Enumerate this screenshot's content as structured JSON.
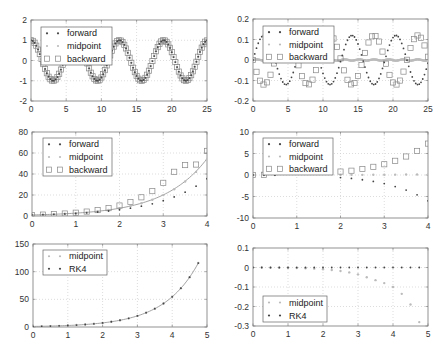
{
  "figure": {
    "width": 446,
    "height": 350,
    "grid": "dotted",
    "frame_color": "#777777"
  },
  "colors": {
    "dark": "#444444",
    "light": "#bbbbbb",
    "square": "#888888",
    "line": "#999999"
  },
  "chart_data": [
    {
      "id": "p1",
      "type": "line",
      "title": "",
      "xlabel": "",
      "ylabel": "",
      "frame": [
        31,
        20,
        207,
        101
      ],
      "xlim": [
        0,
        25
      ],
      "ylim": [
        -2,
        2
      ],
      "xticks": [
        0,
        5,
        10,
        15,
        20,
        25
      ],
      "yticks": [
        -2,
        -1,
        0,
        1,
        2
      ],
      "xtick_labels": [
        "0",
        "5",
        "10",
        "15",
        "20",
        "25"
      ],
      "ytick_labels": [
        "-2",
        "-1",
        "0",
        "1",
        "2"
      ],
      "legend": {
        "position": "upper left",
        "box": [
          41,
          27,
          112,
          65
        ],
        "entries": [
          "forward",
          "midpoint",
          "backward"
        ]
      },
      "series": [
        {
          "name": "forward",
          "marker": "dot",
          "color": "#444444",
          "func": "cos",
          "amp": 1.0,
          "growth": 0,
          "h": 0.25,
          "xmax": 25
        },
        {
          "name": "midpoint",
          "marker": "dot",
          "color": "#bbbbbb",
          "func": "cos",
          "amp": 1.0,
          "growth": 0,
          "h": 0.25,
          "xmax": 25
        },
        {
          "name": "backward",
          "marker": "square",
          "color": "#888888",
          "func": "cos",
          "amp": 1.0,
          "growth": 0,
          "h": 0.25,
          "xmax": 25
        }
      ],
      "description": "Numerical solutions of a harmonic oscillator; all three methods overlap at cos(t) with amplitude ~1"
    },
    {
      "id": "p2",
      "type": "line",
      "title": "",
      "xlabel": "",
      "ylabel": "",
      "frame": [
        253,
        19,
        428,
        101
      ],
      "xlim": [
        0,
        25
      ],
      "ylim": [
        -0.2,
        0.2
      ],
      "xticks": [
        0,
        5,
        10,
        15,
        20,
        25
      ],
      "yticks": [
        -0.2,
        -0.1,
        0,
        0.1,
        0.2
      ],
      "xtick_labels": [
        "0",
        "5",
        "10",
        "15",
        "20",
        "25"
      ],
      "ytick_labels": [
        "-0.2",
        "-0.1",
        "0",
        "0.1",
        "0.2"
      ],
      "legend": {
        "position": "upper left",
        "box": [
          263,
          26,
          334,
          63
        ],
        "entries": [
          "forward",
          "midpoint",
          "backward"
        ]
      },
      "series": [
        {
          "name": "forward",
          "marker": "dot",
          "color": "#444444",
          "func": "sin",
          "amp": 0.12,
          "growth": 0,
          "h": 0.25,
          "xmax": 25
        },
        {
          "name": "midpoint",
          "marker": "dot",
          "color": "#bbbbbb",
          "func": "zero",
          "amp": 0.003,
          "growth": 0,
          "h": 0.1,
          "xmax": 25
        },
        {
          "name": "backward",
          "marker": "square",
          "color": "#888888",
          "func": "-sin",
          "amp": 0.12,
          "growth": 0,
          "h": 0.5,
          "xmax": 25
        }
      ],
      "description": "Error curves: forward ~ +0.12 sin(t), backward ~ -0.12 sin(t), midpoint ~ 0"
    },
    {
      "id": "p3",
      "type": "line",
      "title": "",
      "xlabel": "",
      "ylabel": "",
      "frame": [
        32,
        132,
        207,
        216
      ],
      "xlim": [
        0,
        4
      ],
      "ylim": [
        0,
        80
      ],
      "xticks": [
        0,
        1,
        2,
        3,
        4
      ],
      "yticks": [
        0,
        20,
        40,
        60,
        80
      ],
      "xtick_labels": [
        "0",
        "1",
        "2",
        "3",
        "4"
      ],
      "ytick_labels": [
        "0",
        "20",
        "40",
        "60",
        "80"
      ],
      "legend": {
        "position": "upper left",
        "box": [
          43,
          138,
          112,
          176
        ],
        "entries": [
          "forward",
          "midpoint",
          "backward"
        ]
      },
      "reference_line": {
        "func": "exp",
        "values_at_x": {
          "0": 1,
          "1": 2.72,
          "2": 7.39,
          "3": 20.1,
          "4": 54.6
        }
      },
      "series": [
        {
          "name": "forward",
          "marker": "dot",
          "color": "#444444",
          "x": [
            0,
            0.25,
            0.5,
            0.75,
            1,
            1.25,
            1.5,
            1.75,
            2,
            2.25,
            2.5,
            2.75,
            3,
            3.25,
            3.5,
            3.75,
            4
          ],
          "y": [
            1,
            1.25,
            1.56,
            1.95,
            2.44,
            3.05,
            3.81,
            4.77,
            5.96,
            7.45,
            9.31,
            11.6,
            14.6,
            18.2,
            22.7,
            28.4,
            35.5
          ]
        },
        {
          "name": "midpoint",
          "marker": "dot",
          "color": "#bbbbbb",
          "x": [
            0,
            0.25,
            0.5,
            0.75,
            1,
            1.25,
            1.5,
            1.75,
            2,
            2.25,
            2.5,
            2.75,
            3,
            3.25,
            3.5,
            3.75,
            4
          ],
          "y": [
            1,
            1.28,
            1.64,
            2.11,
            2.71,
            3.48,
            4.46,
            5.72,
            7.34,
            9.42,
            12.1,
            15.5,
            19.9,
            25.5,
            32.8,
            42.0,
            53.9
          ]
        },
        {
          "name": "backward",
          "marker": "square",
          "color": "#888888",
          "x": [
            0,
            0.25,
            0.5,
            0.75,
            1,
            1.25,
            1.5,
            1.75,
            2,
            2.25,
            2.5,
            2.75,
            3,
            3.25,
            3.5,
            3.75,
            4
          ],
          "y": [
            1,
            1.33,
            1.78,
            2.37,
            3.16,
            4.21,
            5.62,
            7.49,
            9.99,
            13.3,
            17.8,
            23.7,
            31.6,
            42.1,
            48.5,
            49,
            62
          ]
        }
      ],
      "description": "Exponential growth y'=y; backward overshoots (~62 at x=4), forward undershoots (~50), midpoint near exp(x)"
    },
    {
      "id": "p4",
      "type": "scatter",
      "title": "",
      "xlabel": "",
      "ylabel": "",
      "frame": [
        253,
        132,
        428,
        218
      ],
      "xlim": [
        0,
        4
      ],
      "ylim": [
        -10,
        10
      ],
      "xticks": [
        0,
        1,
        2,
        3,
        4
      ],
      "yticks": [
        -10,
        -5,
        0,
        5,
        10
      ],
      "xtick_labels": [
        "0",
        "1",
        "2",
        "3",
        "4"
      ],
      "ytick_labels": [
        "-10",
        "-5",
        "0",
        "5",
        "10"
      ],
      "legend": {
        "position": "upper left",
        "box": [
          263,
          138,
          333,
          175
        ],
        "entries": [
          "forward",
          "midpoint",
          "backward"
        ]
      },
      "series": [
        {
          "name": "forward",
          "marker": "dot",
          "color": "#444444",
          "x": [
            0,
            0.25,
            0.5,
            2,
            2.25,
            2.5,
            2.75,
            3,
            3.25,
            3.5,
            3.75,
            4
          ],
          "y": [
            0,
            -0.02,
            -0.05,
            -0.6,
            -0.8,
            -1.1,
            -1.5,
            -2.0,
            -2.7,
            -3.5,
            -4.6,
            -6.0
          ]
        },
        {
          "name": "midpoint",
          "marker": "dot",
          "color": "#bbbbbb",
          "x": [
            0,
            0.25,
            0.5,
            2,
            2.25,
            2.5,
            2.75,
            3,
            3.25,
            3.5,
            3.75,
            4
          ],
          "y": [
            0,
            0,
            0,
            0.02,
            0.03,
            0.04,
            0.05,
            0.06,
            0.08,
            0.1,
            0.12,
            0.15
          ]
        },
        {
          "name": "backward",
          "marker": "square",
          "color": "#888888",
          "x": [
            0,
            0.25,
            2,
            2.25,
            2.5,
            2.75,
            3,
            3.25,
            3.5,
            3.75,
            4
          ],
          "y": [
            0,
            0.05,
            0.8,
            1.0,
            1.4,
            1.9,
            2.5,
            3.3,
            4.3,
            5.6,
            7.3
          ]
        }
      ],
      "description": "Errors vs exact solution: backward positive growing to ~7.3, forward negative to ~-6, midpoint ~0"
    },
    {
      "id": "p5",
      "type": "line",
      "title": "",
      "xlabel": "",
      "ylabel": "",
      "frame": [
        33,
        244,
        207,
        327
      ],
      "xlim": [
        0,
        5
      ],
      "ylim": [
        0,
        150
      ],
      "xticks": [
        0,
        1,
        2,
        3,
        4,
        5
      ],
      "yticks": [
        0,
        50,
        100,
        150
      ],
      "xtick_labels": [
        "0",
        "1",
        "2",
        "3",
        "4",
        "5"
      ],
      "ytick_labels": [
        "0",
        "50",
        "100",
        "150"
      ],
      "legend": {
        "position": "upper left",
        "box": [
          43,
          250,
          107,
          275
        ],
        "entries": [
          "midpoint",
          "RK4"
        ]
      },
      "reference_line": {
        "func": "exp",
        "xmax": 4.75
      },
      "series": [
        {
          "name": "midpoint",
          "marker": "dot",
          "color": "#bbbbbb",
          "x": [
            0,
            0.25,
            0.5,
            0.75,
            1,
            1.25,
            1.5,
            1.75,
            2,
            2.25,
            2.5,
            2.75,
            3,
            3.25,
            3.5,
            3.75,
            4,
            4.25,
            4.5,
            4.75
          ],
          "y": [
            1,
            1.28,
            1.65,
            2.12,
            2.72,
            3.49,
            4.48,
            5.75,
            7.38,
            9.48,
            12.2,
            15.6,
            20.1,
            25.8,
            33.1,
            42.5,
            54.6,
            70.1,
            90.0,
            115.6
          ]
        },
        {
          "name": "RK4",
          "marker": "dot",
          "color": "#444444",
          "x": [
            0,
            0.25,
            0.5,
            0.75,
            1,
            1.25,
            1.5,
            1.75,
            2,
            2.25,
            2.5,
            2.75,
            3,
            3.25,
            3.5,
            3.75,
            4,
            4.25,
            4.5,
            4.75
          ],
          "y": [
            1,
            1.28,
            1.65,
            2.12,
            2.72,
            3.49,
            4.48,
            5.75,
            7.39,
            9.49,
            12.2,
            15.6,
            20.1,
            25.8,
            33.1,
            42.5,
            54.6,
            70.1,
            90.0,
            115.6
          ]
        }
      ],
      "description": "Midpoint and RK4 solutions of y'=y overlap on exp(x), reaching ~118 at x=4.75"
    },
    {
      "id": "p6",
      "type": "scatter",
      "title": "",
      "xlabel": "",
      "ylabel": "",
      "frame": [
        253,
        248,
        428,
        326
      ],
      "xlim": [
        0,
        5
      ],
      "ylim": [
        -0.3,
        0.1
      ],
      "xticks": [
        0,
        1,
        2,
        3,
        4,
        5
      ],
      "yticks": [
        -0.3,
        -0.2,
        -0.1,
        0,
        0.1
      ],
      "xtick_labels": [
        "0",
        "1",
        "2",
        "3",
        "4",
        "5"
      ],
      "ytick_labels": [
        "-0.3",
        "-0.2",
        "-0.1",
        "0",
        "0.1"
      ],
      "legend": {
        "position": "lower left",
        "box": [
          263,
          296,
          327,
          322
        ],
        "entries": [
          "midpoint",
          "RK4"
        ]
      },
      "series": [
        {
          "name": "midpoint",
          "marker": "dot",
          "color": "#bbbbbb",
          "x": [
            0,
            0.25,
            0.5,
            0.75,
            1,
            1.25,
            1.5,
            1.75,
            2,
            2.25,
            2.5,
            2.75,
            3,
            3.25,
            3.5,
            3.75,
            4,
            4.25,
            4.5,
            4.75
          ],
          "y": [
            0,
            0,
            -0.001,
            -0.001,
            -0.002,
            -0.003,
            -0.004,
            -0.006,
            -0.009,
            -0.013,
            -0.018,
            -0.025,
            -0.035,
            -0.05,
            -0.065,
            -0.08,
            -0.1,
            -0.135,
            -0.19,
            -0.28
          ]
        },
        {
          "name": "RK4",
          "marker": "dot",
          "color": "#444444",
          "x": [
            0,
            0.25,
            0.5,
            0.75,
            1,
            1.25,
            1.5,
            1.75,
            2,
            2.25,
            2.5,
            2.75,
            3,
            3.25,
            3.5,
            3.75,
            4,
            4.25,
            4.5,
            4.75
          ],
          "y": [
            0,
            0,
            0,
            0,
            0,
            0,
            0,
            0,
            0,
            0,
            0,
            0,
            0,
            0,
            0,
            0,
            0,
            0,
            0,
            0
          ]
        }
      ],
      "description": "Errors: RK4 ~0 throughout, midpoint drifts negative to about -0.28 at x=4.75"
    }
  ]
}
